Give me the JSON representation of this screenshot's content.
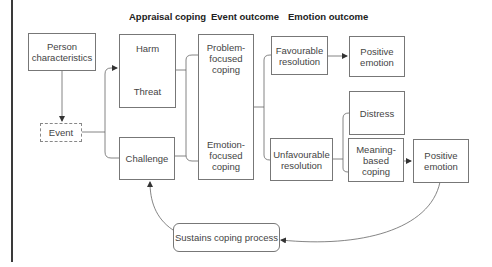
{
  "headers": {
    "appraisal_coping": "Appraisal coping",
    "event_outcome": "Event outcome",
    "emotion_outcome": "Emotion outcome"
  },
  "nodes": {
    "person_characteristics": "Person\ncharacteristics",
    "event": "Event",
    "harm": "Harm",
    "threat": "Threat",
    "challenge": "Challenge",
    "problem_focused_coping": "Problem-\nfocused\ncoping",
    "emotion_focused_coping": "Emotion-\nfocused\ncoping",
    "favourable_resolution": "Favourable\nresolution",
    "positive_emotion_top": "Positive\nemotion",
    "distress": "Distress",
    "unfavourable_resolution": "Unfavourable\nresolution",
    "meaning_based_coping": "Meaning-\nbased\ncoping",
    "positive_emotion_right": "Positive\nemotion",
    "sustains_coping_process": "Sustains coping process"
  },
  "colors": {
    "line": "#555555",
    "border": "#777777",
    "text": "#444444",
    "header": "#222222"
  }
}
